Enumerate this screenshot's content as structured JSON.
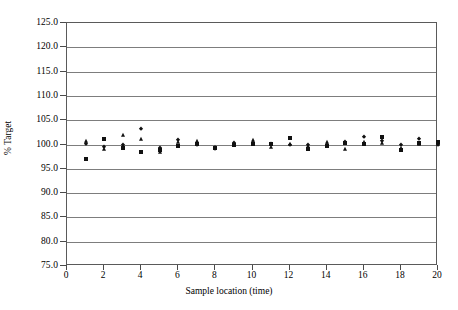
{
  "chart_data": {
    "type": "scatter",
    "title": "",
    "xlabel": "Sample location (time)",
    "ylabel": "% Target",
    "xlim": [
      0,
      20
    ],
    "ylim": [
      75.0,
      125.0
    ],
    "grid": true,
    "legend": "none",
    "x_ticks": [
      0,
      2,
      4,
      6,
      8,
      10,
      12,
      14,
      16,
      18,
      20
    ],
    "x_tick_labels": [
      "0",
      "2",
      "4",
      "6",
      "8",
      "10",
      "12",
      "14",
      "16",
      "18",
      "20"
    ],
    "y_ticks": [
      75.0,
      80.0,
      85.0,
      90.0,
      95.0,
      100.0,
      105.0,
      110.0,
      115.0,
      120.0,
      125.0
    ],
    "y_tick_labels": [
      "75.0",
      "80.0",
      "85.0",
      "90.0",
      "95.0",
      "100.0",
      "105.0",
      "110.0",
      "115.0",
      "120.0",
      "125.0"
    ],
    "categories": [
      1,
      2,
      3,
      4,
      5,
      6,
      7,
      8,
      9,
      10,
      11,
      12,
      13,
      14,
      15,
      16,
      17,
      18,
      19,
      20
    ],
    "series": [
      {
        "name": "Series 1",
        "marker": "square",
        "values": [
          97.1,
          101.2,
          99.2,
          98.4,
          98.9,
          99.6,
          100.1,
          99.2,
          100.0,
          100.2,
          100.1,
          101.4,
          99.1,
          99.7,
          100.4,
          100.1,
          101.5,
          98.9,
          100.3,
          100.5
        ]
      },
      {
        "name": "Series 2",
        "marker": "triangle",
        "values": [
          100.7,
          99.0,
          101.9,
          101.1,
          98.5,
          100.5,
          100.8,
          99.5,
          99.9,
          101.0,
          99.4,
          100.1,
          99.6,
          100.6,
          99.1,
          100.6,
          100.4,
          99.2,
          100.2,
          100.1
        ]
      },
      {
        "name": "Series 3",
        "marker": "diamond",
        "values": [
          100.2,
          99.4,
          100.0,
          103.2,
          99.2,
          100.9,
          99.8,
          99.0,
          100.4,
          100.3,
          100.2,
          100.0,
          100.0,
          100.0,
          100.5,
          101.5,
          100.8,
          99.9,
          101.2,
          99.8
        ]
      }
    ]
  }
}
